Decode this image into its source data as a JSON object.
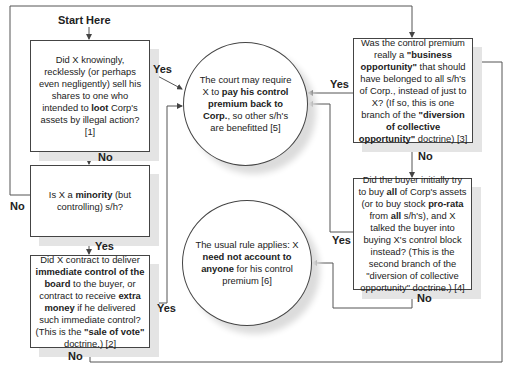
{
  "start_label": "Start Here",
  "nodes": {
    "q1": {
      "pre": "Did X knowingly, recklessly (or perhaps even negligently) sell his shares to one who intended to ",
      "b1": "loot",
      "post": " Corp's assets by illegal action? [1]"
    },
    "q2": {
      "pre": "Is X a ",
      "b1": "minority",
      "post": " (but controlling) s/h?"
    },
    "q3": {
      "pre": "Did X contract to deliver ",
      "b1": "immediate control of the board",
      "mid": " to the buyer, or contract to receive ",
      "b2": "extra money",
      "mid2": " if he delivered such immediate control? (This is the ",
      "b3": "\"sale of vote\"",
      "post": " doctrine.) [2]"
    },
    "q4": {
      "pre": "Was the control premium really a ",
      "b1": "\"business opportunity\"",
      "mid": " that should have belonged to all s/h's of Corp., instead of just to X? (If so, this is one branch of the ",
      "b2": "\"diversion of collective opportunity\"",
      "post": " doctrine) [3]"
    },
    "q5": {
      "pre": "Did the buyer initially try to buy ",
      "b1": "all",
      "mid": " of Corp's assets (or to buy stock ",
      "b2": "pro-rata",
      "mid2": " from ",
      "b3": "all",
      "post": " s/h's), and X talked the buyer into buying X's control block instead? (This is the second branch of the \"diversion of collective opportunity\" doctrine.) [4]"
    },
    "r1": {
      "pre": "The court may require X to ",
      "b1": "pay his control premium back to Corp.",
      "post": ", so other s/h's are benefitted [5]"
    },
    "r2": {
      "pre": "The usual rule applies: X ",
      "b1": "need not account to anyone",
      "post": " for his control premium [6]"
    }
  },
  "edge_labels": {
    "q1_yes": "Yes",
    "q1_no": "No",
    "q2_no": "No",
    "q2_yes": "Yes",
    "q3_yes": "Yes",
    "q3_no": "No",
    "q4_yes": "Yes",
    "q4_no": "No",
    "q5_yes": "Yes",
    "q5_no": "No"
  },
  "colors": {
    "line": "#444444",
    "shadow": "#e4e4e4"
  }
}
